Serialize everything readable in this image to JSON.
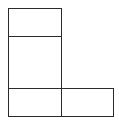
{
  "diagram": {
    "type": "net-of-squares",
    "stroke_color": "#2b2b2b",
    "background": "#ffffff",
    "cells": [
      {
        "id": "top",
        "x": 8,
        "y": 8,
        "w": 54,
        "h": 29
      },
      {
        "id": "middle",
        "x": 8,
        "y": 36,
        "w": 54,
        "h": 53
      },
      {
        "id": "bottom-left",
        "x": 8,
        "y": 88,
        "w": 54,
        "h": 29
      },
      {
        "id": "bottom-right",
        "x": 61,
        "y": 88,
        "w": 53,
        "h": 29
      }
    ]
  }
}
